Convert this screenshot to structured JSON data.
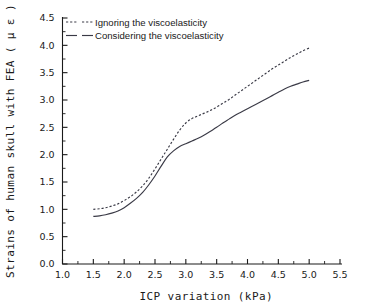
{
  "chart_data": {
    "type": "line",
    "title": "",
    "xlabel": "ICP variation (kPa)",
    "ylabel": "Strains of human skull with FEA ( μ ε )",
    "xlim": [
      1.0,
      5.5
    ],
    "ylim": [
      0.0,
      4.5
    ],
    "xticks": [
      "1.0",
      "1.5",
      "2.0",
      "2.5",
      "3.0",
      "3.5",
      "4.0",
      "4.5",
      "5.0",
      "5.5"
    ],
    "xtick_values": [
      1.0,
      1.5,
      2.0,
      2.5,
      3.0,
      3.5,
      4.0,
      4.5,
      5.0,
      5.5
    ],
    "yticks": [
      "0.0",
      "0.5",
      "1.0",
      "1.5",
      "2.0",
      "2.5",
      "3.0",
      "3.5",
      "4.0",
      "4.5"
    ],
    "ytick_values": [
      0.0,
      0.5,
      1.0,
      1.5,
      2.0,
      2.5,
      3.0,
      3.5,
      4.0,
      4.5
    ],
    "grid": false,
    "minor_ticks": true,
    "legend_position": "upper left",
    "x": [
      1.5,
      1.6,
      1.7,
      1.8,
      1.9,
      2.0,
      2.1,
      2.2,
      2.3,
      2.4,
      2.5,
      2.6,
      2.7,
      2.8,
      2.9,
      3.0,
      3.1,
      3.2,
      3.3,
      3.4,
      3.5,
      3.6,
      3.7,
      3.8,
      3.9,
      4.0,
      4.1,
      4.2,
      4.3,
      4.4,
      4.5,
      4.6,
      4.7,
      4.8,
      4.9,
      5.0
    ],
    "series": [
      {
        "name": "Ignoring the viscoelasticity",
        "style": "dotted",
        "color": "#3a3a46",
        "values": [
          1.0,
          1.01,
          1.03,
          1.06,
          1.1,
          1.16,
          1.23,
          1.32,
          1.43,
          1.57,
          1.74,
          1.92,
          2.1,
          2.28,
          2.45,
          2.58,
          2.66,
          2.71,
          2.76,
          2.81,
          2.87,
          2.94,
          3.01,
          3.09,
          3.17,
          3.25,
          3.33,
          3.41,
          3.49,
          3.57,
          3.64,
          3.71,
          3.78,
          3.84,
          3.9,
          3.95
        ]
      },
      {
        "name": "Considering the viscoelasticity",
        "style": "solid",
        "color": "#3a3a46",
        "values": [
          0.87,
          0.88,
          0.9,
          0.93,
          0.97,
          1.03,
          1.11,
          1.2,
          1.31,
          1.45,
          1.61,
          1.79,
          1.96,
          2.07,
          2.15,
          2.2,
          2.25,
          2.3,
          2.36,
          2.43,
          2.5,
          2.58,
          2.65,
          2.72,
          2.78,
          2.84,
          2.9,
          2.96,
          3.02,
          3.08,
          3.14,
          3.2,
          3.25,
          3.29,
          3.33,
          3.36
        ]
      }
    ],
    "legend": [
      {
        "label": "Ignoring the viscoelasticity",
        "style": "dotted"
      },
      {
        "label": "Considering the viscoelasticity",
        "style": "solid"
      }
    ]
  }
}
